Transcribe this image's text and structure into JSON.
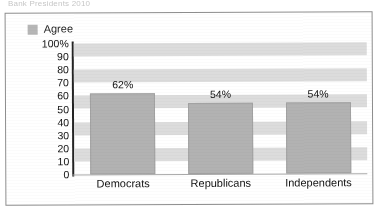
{
  "scan": {
    "top_caption_fragment": "Bank Presidents 2010"
  },
  "legend": {
    "entries": [
      {
        "label": "Agree",
        "color": "#b6b6b6"
      }
    ],
    "position": "top-left"
  },
  "axes": {
    "y_ticks": [
      "100%",
      "90",
      "80",
      "70",
      "60",
      "50",
      "40",
      "30",
      "20",
      "10",
      "0"
    ],
    "y_tick_values": [
      100,
      90,
      80,
      70,
      60,
      50,
      40,
      30,
      20,
      10,
      0
    ]
  },
  "bars": [
    {
      "category": "Democrats",
      "value": 62,
      "label": "62%"
    },
    {
      "category": "Republicans",
      "value": 54,
      "label": "54%"
    },
    {
      "category": "Independents",
      "value": 54,
      "label": "54%"
    }
  ],
  "colors": {
    "bar_fill": "#b2b2b2",
    "bar_stroke": "#a2a2a2",
    "band": "#dcdcdc",
    "axis": "#242424",
    "frame": "#8d8d8d",
    "text": "#111111"
  },
  "chart_data": {
    "type": "bar",
    "title": "",
    "xlabel": "",
    "ylabel": "",
    "categories": [
      "Democrats",
      "Republicans",
      "Independents"
    ],
    "values": [
      62,
      54,
      54
    ],
    "series": [
      {
        "name": "Agree",
        "values": [
          62,
          54,
          54
        ]
      }
    ],
    "data_labels": [
      "62%",
      "54%",
      "54%"
    ],
    "ylim": [
      0,
      100
    ],
    "ytick_step": 10,
    "ytick_labels": [
      "0",
      "10",
      "20",
      "30",
      "40",
      "50",
      "60",
      "70",
      "80",
      "90",
      "100%"
    ],
    "grid": "horizontal-bands",
    "legend": [
      "Agree"
    ],
    "legend_position": "top-left",
    "units": "percent"
  }
}
